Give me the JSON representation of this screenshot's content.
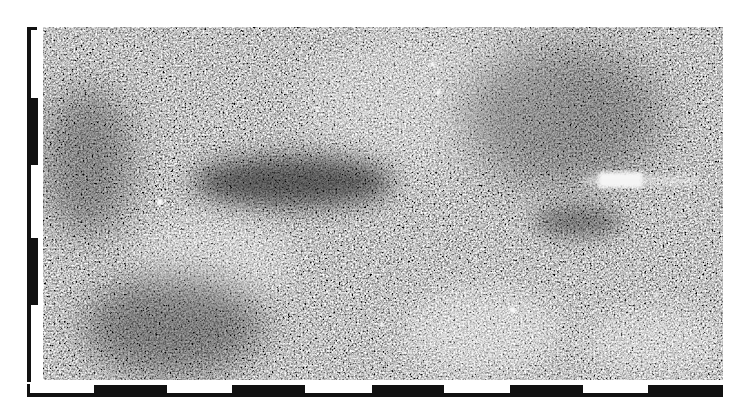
{
  "image": {
    "kind": "grayscale radar (SAR) speckle image",
    "colors": {
      "background": "#ffffff",
      "scale_black": "#111111",
      "image_mid_gray": "#8a8a8a",
      "hotspot": "#fafafa"
    }
  },
  "scale_bar_vertical": {
    "position": "left",
    "segments": [
      {
        "color": "white",
        "top": 27,
        "bottom": 98
      },
      {
        "color": "black",
        "top": 98,
        "bottom": 165
      },
      {
        "color": "white",
        "top": 165,
        "bottom": 238
      },
      {
        "color": "black",
        "top": 238,
        "bottom": 305
      },
      {
        "color": "white",
        "top": 305,
        "bottom": 380
      }
    ]
  },
  "scale_bar_horizontal": {
    "position": "bottom",
    "segments": [
      {
        "color": "white",
        "left": 27,
        "right": 94
      },
      {
        "color": "black",
        "left": 94,
        "right": 167
      },
      {
        "color": "white",
        "left": 167,
        "right": 232
      },
      {
        "color": "black",
        "left": 232,
        "right": 305
      },
      {
        "color": "white",
        "left": 305,
        "right": 372
      },
      {
        "color": "black",
        "left": 372,
        "right": 444
      },
      {
        "color": "white",
        "left": 444,
        "right": 510
      },
      {
        "color": "black",
        "left": 510,
        "right": 583
      },
      {
        "color": "white",
        "left": 583,
        "right": 648
      },
      {
        "color": "black",
        "left": 648,
        "right": 723
      }
    ]
  }
}
